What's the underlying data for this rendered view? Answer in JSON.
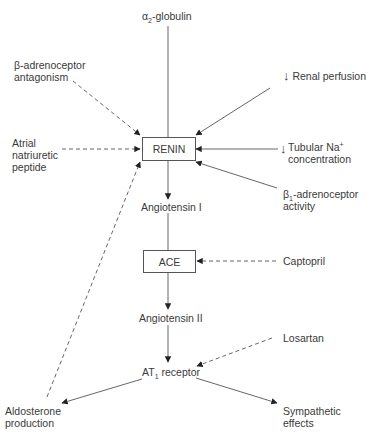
{
  "nodes": {
    "alpha2_globulin": {
      "symbol": "α",
      "sub": "2",
      "text": "-globulin"
    },
    "beta_antagonism": {
      "line1": "β-adrenoceptor",
      "line2": "antagonism"
    },
    "renal_perfusion": {
      "arrow": "↓",
      "text": "Renal perfusion"
    },
    "anp": {
      "line1": "Atrial",
      "line2": "natriuretic",
      "line3": "peptide"
    },
    "renin": {
      "label": "RENIN"
    },
    "tubular_na": {
      "arrow": "↓",
      "line1": "Tubular Na",
      "sup": "+",
      "line2": "concentration"
    },
    "beta1_activity": {
      "symbol": "β",
      "sub": "1",
      "line1": "-adrenoceptor",
      "line2": "activity"
    },
    "angiotensin1": {
      "label": "Angiotensin I"
    },
    "ace": {
      "label": "ACE"
    },
    "captopril": {
      "label": "Captopril"
    },
    "angiotensin2": {
      "label": "Angiotensin II"
    },
    "losartan": {
      "label": "Losartan"
    },
    "at1_receptor": {
      "prefix": "AT",
      "sub": "1",
      "suffix": " receptor"
    },
    "aldosterone": {
      "line1": "Aldosterone",
      "line2": "production"
    },
    "sympathetic": {
      "line1": "Sympathetic",
      "line2": "effects"
    }
  },
  "edges": [
    {
      "from": "alpha2_globulin",
      "to": "renin",
      "style": "solid"
    },
    {
      "from": "renal_perfusion",
      "to": "renin",
      "style": "solid"
    },
    {
      "from": "tubular_na",
      "to": "renin",
      "style": "solid"
    },
    {
      "from": "beta1_activity",
      "to": "renin",
      "style": "solid"
    },
    {
      "from": "beta_antagonism",
      "to": "renin",
      "style": "dashed"
    },
    {
      "from": "anp",
      "to": "renin",
      "style": "dashed"
    },
    {
      "from": "aldosterone",
      "to": "renin",
      "style": "dashed"
    },
    {
      "from": "renin",
      "to": "angiotensin1",
      "style": "solid"
    },
    {
      "from": "angiotensin1",
      "to": "ace",
      "style": "solid"
    },
    {
      "from": "captopril",
      "to": "ace",
      "style": "dashed"
    },
    {
      "from": "ace",
      "to": "angiotensin2",
      "style": "solid"
    },
    {
      "from": "angiotensin2",
      "to": "at1_receptor",
      "style": "solid"
    },
    {
      "from": "losartan",
      "to": "at1_receptor",
      "style": "dashed"
    },
    {
      "from": "at1_receptor",
      "to": "aldosterone",
      "style": "solid"
    },
    {
      "from": "at1_receptor",
      "to": "sympathetic",
      "style": "solid"
    }
  ],
  "colors": {
    "line": "#555555",
    "text": "#3a3a3a",
    "background": "#ffffff"
  }
}
